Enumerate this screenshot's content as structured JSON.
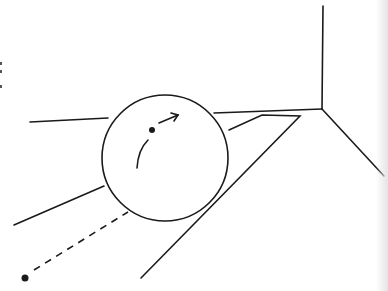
{
  "figure": {
    "colors": {
      "stroke": "#1a1a1a",
      "background": "#ffffff",
      "edge_shade": "#e4e4e4"
    },
    "sphere": {
      "cx": 165,
      "cy": 158,
      "r": 63
    },
    "point_marker": {
      "cx": 25,
      "cy": 278
    },
    "center_dot": {
      "cx": 152,
      "cy": 130
    }
  }
}
